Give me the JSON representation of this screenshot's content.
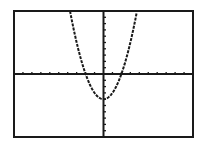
{
  "screen": {
    "description": "Graphing calculator window displaying a parabola",
    "background": "#ffffff",
    "ink": "#1a1a1a"
  },
  "chart_data": {
    "type": "line",
    "title": "",
    "xlabel": "",
    "ylabel": "",
    "function": "y = x^2 - 4",
    "xlim": [
      -10,
      10
    ],
    "ylim": [
      -10,
      10
    ],
    "xscl": 1,
    "yscl": 1,
    "grid": false,
    "axes": true,
    "vertex": [
      0,
      -4
    ],
    "x_intercepts": [
      -2,
      2
    ],
    "y_intercept": -4,
    "series": [
      {
        "name": "Y1",
        "x": [
          -3.74,
          -3.5,
          -3,
          -2.5,
          -2,
          -1.5,
          -1,
          -0.5,
          0,
          0.5,
          1,
          1.5,
          2,
          2.5,
          3,
          3.5,
          3.74
        ],
        "values": [
          10,
          8.25,
          5,
          2.25,
          0,
          -1.75,
          -3,
          -3.75,
          -4,
          -3.75,
          -3,
          -1.75,
          0,
          2.25,
          5,
          8.25,
          10
        ]
      }
    ]
  },
  "layout": {
    "frame": {
      "left": 14,
      "top": 11,
      "right": 193,
      "bottom": 137
    }
  }
}
